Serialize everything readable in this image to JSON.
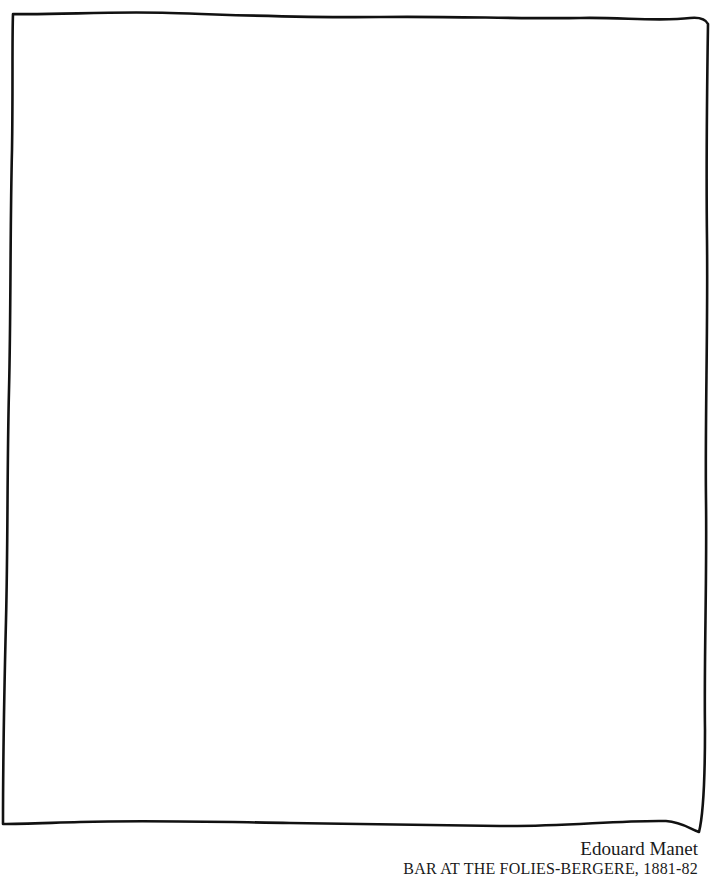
{
  "artwork": {
    "frame_style": "hand-drawn empty rectangle",
    "frame_color": "#111111",
    "background_color": "#ffffff"
  },
  "caption": {
    "artist": "Edouard Manet",
    "title": "BAR AT THE FOLIES-BERGERE, 1881-82"
  }
}
